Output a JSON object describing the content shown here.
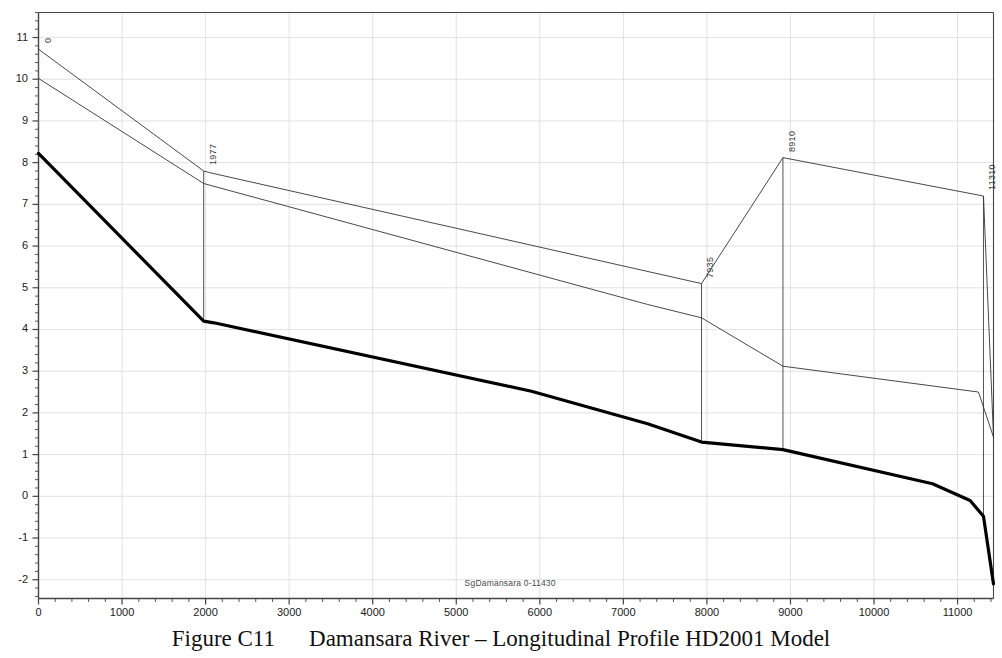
{
  "caption": {
    "figure_number": "Figure C11",
    "text": "Damansara River – Longitudinal Profile HD2001 Model"
  },
  "series_label": "SgDamansara 0-11430",
  "chart_data": {
    "type": "line",
    "title": "Damansara River – Longitudinal Profile HD2001 Model",
    "subtitle": "SgDamansara 0-11430",
    "xlabel": "",
    "ylabel": "",
    "xlim": [
      0,
      11430
    ],
    "ylim": [
      -2.45,
      11.6
    ],
    "xticks": [
      0,
      1000,
      2000,
      3000,
      4000,
      5000,
      6000,
      7000,
      8000,
      9000,
      10000,
      11000
    ],
    "xtick_labels": [
      "0",
      "1000",
      "2000",
      "3000",
      "4000",
      "5000",
      "6000",
      "7000",
      "8000",
      "9000",
      "10000",
      "11000"
    ],
    "xminor_step": 200,
    "yticks": [
      -2,
      -1,
      0,
      1,
      2,
      3,
      4,
      5,
      6,
      7,
      8,
      9,
      10,
      11
    ],
    "ytick_labels": [
      "-2",
      "-1",
      "0",
      "1",
      "2",
      "3",
      "4",
      "5",
      "6",
      "7",
      "8",
      "9",
      "10",
      "11"
    ],
    "yminor_step": 0.2,
    "grid": true,
    "legend": "none",
    "series": [
      {
        "name": "left-bank-top",
        "style": "thin",
        "color": "#333333",
        "width": 0.9,
        "points": [
          [
            0,
            10.72
          ],
          [
            1977,
            7.8
          ],
          [
            2050,
            7.76
          ],
          [
            7935,
            5.1
          ],
          [
            8910,
            8.12
          ],
          [
            11310,
            7.2
          ],
          [
            11430,
            1.42
          ]
        ]
      },
      {
        "name": "right-bank-top",
        "style": "thin",
        "color": "#333333",
        "width": 0.9,
        "points": [
          [
            0,
            10.02
          ],
          [
            1977,
            7.5
          ],
          [
            2050,
            7.46
          ],
          [
            7290,
            4.6
          ],
          [
            7935,
            4.28
          ],
          [
            8910,
            3.12
          ],
          [
            11250,
            2.5
          ],
          [
            11430,
            1.42
          ]
        ]
      },
      {
        "name": "river-bed",
        "style": "thick",
        "color": "#000000",
        "width": 3.2,
        "points": [
          [
            0,
            8.22
          ],
          [
            1977,
            4.2
          ],
          [
            2100,
            4.16
          ],
          [
            5900,
            2.52
          ],
          [
            7290,
            1.74
          ],
          [
            7935,
            1.3
          ],
          [
            8910,
            1.12
          ],
          [
            10700,
            0.3
          ],
          [
            11150,
            -0.1
          ],
          [
            11310,
            -0.48
          ],
          [
            11430,
            -2.1
          ]
        ]
      }
    ],
    "cross_sections": [
      {
        "chainage": 0,
        "label": "0",
        "y_top": 10.72,
        "y_bottom": 8.22
      },
      {
        "chainage": 1977,
        "label": "1977",
        "y_top": 7.8,
        "y_bottom": 4.2
      },
      {
        "chainage": 7935,
        "label": "7935",
        "y_top": 5.1,
        "y_bottom": 1.3
      },
      {
        "chainage": 8910,
        "label": "8910",
        "y_top": 8.12,
        "y_bottom": 1.12
      },
      {
        "chainage": 11310,
        "label": "11310",
        "y_top": 7.2,
        "y_bottom": -0.48
      }
    ]
  },
  "colors": {
    "axis": "#444444",
    "grid": "#d9d9e0",
    "bed_line": "#000000",
    "bank_line": "#333333",
    "text": "#1a1a1a",
    "background": "#ffffff"
  }
}
